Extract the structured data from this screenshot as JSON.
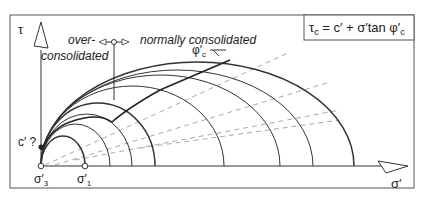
{
  "diagram": {
    "formula": "τc = c′ + σ′tan φ′c",
    "formula_parts": {
      "tau": "τ",
      "tau_sub": "c",
      "eq": " = c′ + σ′tan φ′",
      "phi_sub": "c"
    },
    "axes": {
      "y_label": "τ",
      "x_label": "σ′"
    },
    "regions": {
      "over_1": "over-",
      "over_2": "consolidated",
      "normal": "normally consolidated"
    },
    "labels": {
      "cohesion": "c′ ?",
      "phi": "φ′",
      "phi_sub": "c",
      "sigma3": "σ′",
      "sigma3_sub": "3",
      "sigma1": "σ′",
      "sigma1_sub": "1"
    },
    "colors": {
      "line": "#222222",
      "dashed": "#aaaaaa",
      "border": "#555555"
    },
    "circles": [
      {
        "left": 41,
        "right": 85
      },
      {
        "left": 41,
        "right": 110
      },
      {
        "left": 41,
        "right": 132
      },
      {
        "left": 41,
        "right": 155
      },
      {
        "left": 41,
        "right": 224
      },
      {
        "left": 41,
        "right": 280
      },
      {
        "left": 41,
        "right": 313
      },
      {
        "left": 41,
        "right": 354
      }
    ]
  }
}
